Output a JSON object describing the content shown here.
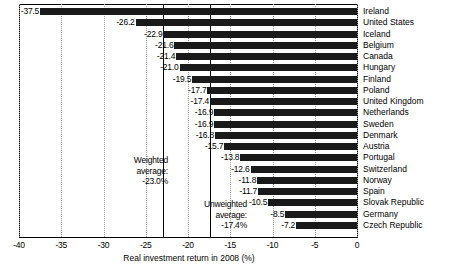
{
  "chart_data": {
    "type": "bar",
    "orientation": "horizontal",
    "title": "",
    "xlabel": "Real investment return in 2008 (%)",
    "ylabel": "",
    "xlim": [
      -40,
      0
    ],
    "xticks": [
      -40,
      -35,
      -30,
      -25,
      -20,
      -15,
      -10,
      -5,
      0
    ],
    "xtick_labels": [
      "-40",
      "-35",
      "-30",
      "-25",
      "-20",
      "-15",
      "-10",
      "-5",
      "0"
    ],
    "grid": "vertical dotted gridlines at each tick",
    "legend": "none",
    "bar_color": "#1a1a1a",
    "categories": [
      "Ireland",
      "United States",
      "Iceland",
      "Belgium",
      "Canada",
      "Hungary",
      "Finland",
      "Poland",
      "United Kingdom",
      "Netherlands",
      "Sweden",
      "Denmark",
      "Austria",
      "Portugal",
      "Switzerland",
      "Norway",
      "Spain",
      "Slovak Republic",
      "Germany",
      "Czech Republic"
    ],
    "values": [
      -37.5,
      -26.2,
      -22.9,
      -21.6,
      -21.4,
      -21.0,
      -19.5,
      -17.7,
      -17.4,
      -16.9,
      -16.9,
      -16.8,
      -15.7,
      -13.8,
      -12.6,
      -11.8,
      -11.7,
      -10.5,
      -8.5,
      -7.2
    ],
    "value_labels": [
      "-37.5",
      "-26.2",
      "-22.9",
      "-21.6",
      "-21.4",
      "-21.0",
      "-19.5",
      "-17.7",
      "-17.4",
      "-16.9",
      "-16.9",
      "-16.8",
      "-15.7",
      "-13.8",
      "-12.6",
      "-11.8",
      "-11.7",
      "-10.5",
      "-8.5",
      "-7.2"
    ],
    "annotations": [
      {
        "name": "weighted-average",
        "text_lines": [
          "Weighted",
          "average:",
          "-23.0%"
        ],
        "value": -23.0,
        "line_style": "solid vertical"
      },
      {
        "name": "unweighted-average",
        "text_lines": [
          "Unweighted",
          "average:",
          "-17.4%"
        ],
        "value": -17.4,
        "line_style": "solid vertical"
      }
    ]
  }
}
